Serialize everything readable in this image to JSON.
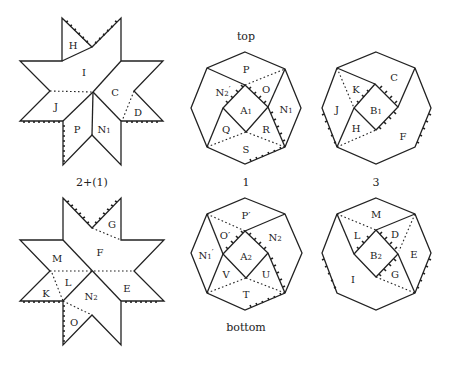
{
  "captions": {
    "top": "top",
    "bottom": "bottom",
    "star_top": "2+(1)",
    "oct_top_mid": "1",
    "oct_top_right": "3"
  },
  "star_top": {
    "labels": {
      "H": "H",
      "I": "I",
      "J": "J",
      "C": "C",
      "D": "D",
      "P": "P",
      "N1": "N",
      "N1_sub": "1"
    }
  },
  "star_bottom": {
    "labels": {
      "G": "G",
      "F": "F",
      "M": "M",
      "L": "L",
      "K": "K",
      "E": "E",
      "N2": "N",
      "N2_sub": "2",
      "O": "O"
    }
  },
  "oct_top_mid": {
    "labels": {
      "P": "P",
      "N2p": "N",
      "N2p_sub": "2",
      "N2p_prime": "′",
      "O": "O",
      "A1": "A",
      "A1_sub": "1",
      "N1": "N",
      "N1_sub": "1",
      "Q": "Q",
      "R": "R",
      "S": "S"
    }
  },
  "oct_top_right": {
    "labels": {
      "C": "C",
      "K": "K",
      "J": "J",
      "B1": "B",
      "B1_sub": "1",
      "H": "H",
      "F": "F"
    }
  },
  "oct_bottom_mid": {
    "labels": {
      "Pp": "P′",
      "Op": "O′",
      "N2": "N",
      "N2_sub": "2",
      "N1p": "N",
      "N1p_sub": "1",
      "N1p_prime": "′",
      "A2": "A",
      "A2_sub": "2",
      "V": "V",
      "U": "U",
      "T": "T"
    }
  },
  "oct_bottom_right": {
    "labels": {
      "M": "M",
      "L": "L",
      "D": "D",
      "B2": "B",
      "B2_sub": "2",
      "E": "E",
      "I": "I",
      "G": "G"
    }
  }
}
